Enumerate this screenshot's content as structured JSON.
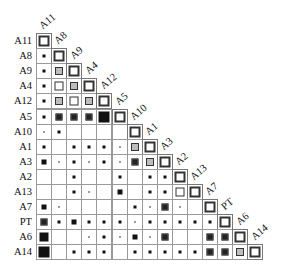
{
  "chart_data": {
    "type": "heatmap",
    "subtype": "lower-triangular correlation matrix (square glyphs)",
    "title": "",
    "variables": [
      "A11",
      "A8",
      "A9",
      "A4",
      "A12",
      "A5",
      "A10",
      "A1",
      "A3",
      "A2",
      "A13",
      "A7",
      "PT",
      "A6",
      "A14"
    ],
    "legend": {
      "": "empty / no association",
      "t": "tiny light dot",
      "s": "small dark dot",
      "m": "medium dark square",
      "L": "large dark square",
      "X": "extra-large dark square",
      "fw": "framed square, white fill",
      "fg": "framed square, gray fill",
      "fk": "framed square, dark fill",
      "D": "diagonal (self)"
    },
    "matrix": [
      [
        "D"
      ],
      [
        "s",
        "D"
      ],
      [
        "s",
        "fg",
        "D"
      ],
      [
        "s",
        "fw",
        "fg",
        "D"
      ],
      [
        "s",
        "fg",
        "fw",
        "fg",
        "D"
      ],
      [
        "s",
        "fk",
        "fk",
        "fk",
        "X",
        "D"
      ],
      [
        "t",
        "s",
        "",
        "",
        "",
        "",
        "D"
      ],
      [
        "s",
        "",
        "s",
        "s",
        "s",
        "t",
        "fg",
        "D"
      ],
      [
        "m",
        "t",
        "s",
        "t",
        "s",
        "t",
        "fk",
        "fg",
        "D"
      ],
      [
        "",
        "",
        "s",
        "",
        "",
        "s",
        "",
        "s",
        "s",
        "D"
      ],
      [
        "",
        "",
        "s",
        "t",
        "",
        "m",
        "",
        "s",
        "s",
        "fw",
        "D"
      ],
      [
        "m",
        "t",
        "",
        "",
        "",
        "",
        "s",
        "t",
        "fk",
        "t",
        "",
        "D"
      ],
      [
        "fk",
        "s",
        "m",
        "s",
        "s",
        "s",
        "t",
        "s",
        "s",
        "s",
        "s",
        "s",
        "D"
      ],
      [
        "L",
        "",
        "",
        "t",
        "s",
        "t",
        "m",
        "t",
        "fk",
        "",
        "",
        "fk",
        "fk",
        "D"
      ],
      [
        "X",
        "",
        "s",
        "s",
        "s",
        "",
        "s",
        "s",
        "s",
        "s",
        "s",
        "fk",
        "fk",
        "fg",
        "D"
      ]
    ],
    "layout": {
      "origin_x": 36,
      "origin_y": 33,
      "cell_size": 15.1,
      "grid": true,
      "legend_position": "none"
    }
  },
  "colors": {
    "grid": "#9a9a9a",
    "dark": "#111111",
    "gray_fill": "#bdbdbd",
    "frame": "#333333",
    "tiny_dot": "#9a9a9a"
  }
}
